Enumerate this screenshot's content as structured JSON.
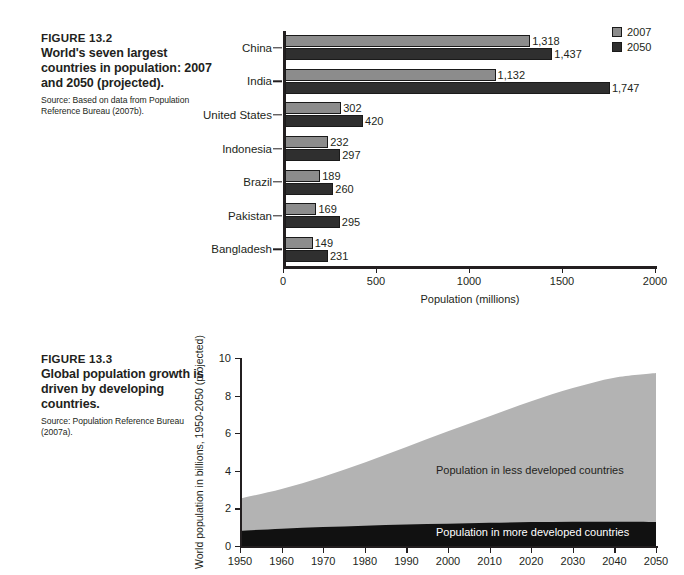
{
  "figure_132": {
    "fig_num": "FIGURE 13.2",
    "title": "World's seven largest countries in population: 2007 and 2050 (projected).",
    "source": "Source: Based on data from Population Reference Bureau (2007b).",
    "legend": [
      {
        "label": "2007",
        "color": "#8c8c8c"
      },
      {
        "label": "2050",
        "color": "#2f2f2f"
      }
    ],
    "chart_data": {
      "type": "bar",
      "orientation": "horizontal",
      "title": "World's seven largest countries in population: 2007 and 2050 (projected)",
      "categories": [
        "China",
        "India",
        "United States",
        "Indonesia",
        "Brazil",
        "Pakistan",
        "Bangladesh"
      ],
      "series": [
        {
          "name": "2007",
          "color": "#8c8c8c",
          "values": [
            1318,
            1132,
            302,
            232,
            189,
            169,
            149
          ],
          "labels": [
            "1,318",
            "1,132",
            "302",
            "232",
            "189",
            "169",
            "149"
          ]
        },
        {
          "name": "2050",
          "color": "#2f2f2f",
          "values": [
            1437,
            1747,
            420,
            297,
            260,
            295,
            231
          ],
          "labels": [
            "1,437",
            "1,747",
            "420",
            "297",
            "260",
            "295",
            "231"
          ]
        }
      ],
      "xlabel": "Population (millions)",
      "ylabel": "",
      "xticks": [
        0,
        500,
        1000,
        1500,
        2000
      ],
      "xtick_labels": [
        "0",
        "500",
        "1000",
        "1500",
        "2000"
      ],
      "xlim": [
        0,
        2000
      ],
      "grid": false,
      "legend_position": "top-right"
    }
  },
  "figure_133": {
    "fig_num": "FIGURE 13.3",
    "title": "Global population growth is driven by developing countries.",
    "source": "Source: Population Reference Bureau (2007a).",
    "annotations": {
      "less_developed": "Population in less developed countries",
      "more_developed": "Population in more developed countries"
    },
    "chart_data": {
      "type": "area",
      "stacked": true,
      "title": "Global population growth is driven by developing countries",
      "xlabel": "",
      "ylabel": "World population in billions, 1950-2050 (projected)",
      "x": [
        1950,
        1960,
        1970,
        1980,
        1990,
        2000,
        2010,
        2020,
        2030,
        2040,
        2050
      ],
      "xticks": [
        1950,
        1960,
        1970,
        1980,
        1990,
        2000,
        2010,
        2020,
        2030,
        2040,
        2050
      ],
      "xtick_labels": [
        "1950",
        "1960",
        "1970",
        "1980",
        "1990",
        "2000",
        "2010",
        "2020",
        "2030",
        "2040",
        "2050"
      ],
      "yticks": [
        0,
        2,
        4,
        6,
        8,
        10
      ],
      "ytick_labels": [
        "0",
        "2",
        "4",
        "6",
        "8",
        "10"
      ],
      "ylim": [
        0,
        10
      ],
      "xlim": [
        1950,
        2050
      ],
      "grid": false,
      "series": [
        {
          "name": "Population in more developed countries",
          "color": "#111111",
          "values": [
            0.81,
            0.92,
            1.01,
            1.08,
            1.15,
            1.19,
            1.24,
            1.27,
            1.29,
            1.29,
            1.28
          ]
        },
        {
          "name": "Population in less developed countries",
          "color": "#b3b3b3",
          "values": [
            1.71,
            2.11,
            2.67,
            3.36,
            4.11,
            4.91,
            5.66,
            6.43,
            7.11,
            7.66,
            7.92
          ]
        }
      ],
      "totals": [
        2.52,
        3.03,
        3.68,
        4.44,
        5.26,
        6.1,
        6.9,
        7.7,
        8.4,
        8.95,
        9.2
      ]
    }
  }
}
